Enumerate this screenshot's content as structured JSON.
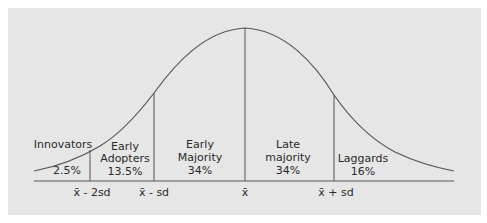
{
  "diagram": {
    "type": "diffusion-of-innovations-bell-curve",
    "colors": {
      "panel_bg": "#e6e6e6",
      "line": "#555555",
      "text": "#2a2a2a"
    },
    "segments": [
      {
        "id": "innovators",
        "label_line1": "Innovators",
        "label_line2": "",
        "percent": "2.5%"
      },
      {
        "id": "early-adopters",
        "label_line1": "Early",
        "label_line2": "Adopters",
        "percent": "13.5%"
      },
      {
        "id": "early-majority",
        "label_line1": "Early",
        "label_line2": "Majority",
        "percent": "34%"
      },
      {
        "id": "late-majority",
        "label_line1": "Late",
        "label_line2": "majority",
        "percent": "34%"
      },
      {
        "id": "laggards",
        "label_line1": "Laggards",
        "label_line2": "",
        "percent": "16%"
      }
    ],
    "axis_ticks": [
      {
        "id": "mean-minus-2sd",
        "label": "x̄ - 2sd"
      },
      {
        "id": "mean-minus-sd",
        "label": "x̄ - sd"
      },
      {
        "id": "mean",
        "label": "x̄"
      },
      {
        "id": "mean-plus-sd",
        "label": "x̄ + sd"
      }
    ]
  }
}
